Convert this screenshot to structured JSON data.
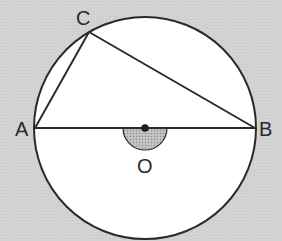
{
  "diagram": {
    "type": "geometry",
    "points": {
      "A": {
        "label": "A",
        "x": 35,
        "y": 128
      },
      "B": {
        "label": "B",
        "x": 255,
        "y": 128
      },
      "C": {
        "label": "C",
        "x": 89,
        "y": 32
      },
      "O": {
        "label": "O",
        "x": 145,
        "y": 128
      }
    },
    "circle": {
      "cx": 145,
      "cy": 128,
      "r": 111
    },
    "segments": [
      {
        "from": "A",
        "to": "B"
      },
      {
        "from": "A",
        "to": "C"
      },
      {
        "from": "C",
        "to": "B"
      }
    ],
    "angle_mark": {
      "at": "O",
      "shape": "semicircle",
      "radius": 22,
      "fill": "#b0b0b0",
      "side": "below"
    },
    "colors": {
      "background": "#d3d3d3",
      "circle_fill": "#ffffff",
      "stroke": "#2a2a2a"
    }
  },
  "labels": {
    "A": "A",
    "B": "B",
    "C": "C",
    "O": "O"
  }
}
